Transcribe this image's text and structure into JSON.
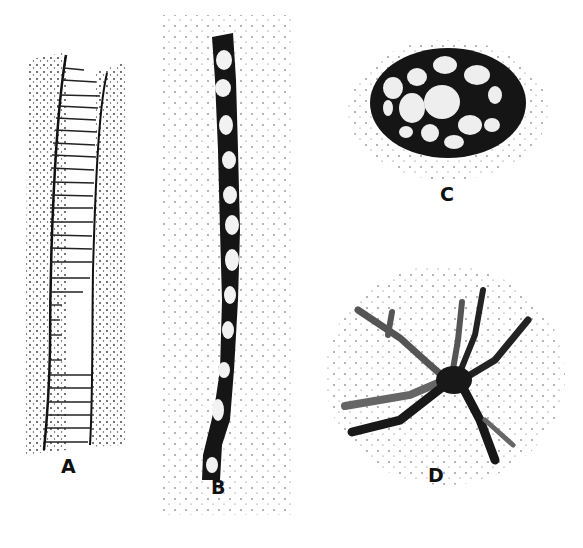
{
  "figure": {
    "panels": [
      {
        "id": "A",
        "label": "A",
        "description": "segmented ribbed tube / filament"
      },
      {
        "id": "B",
        "label": "B",
        "description": "dark chain of cells (filament)"
      },
      {
        "id": "C",
        "label": "C",
        "description": "oval colony with light cells in dark matrix"
      },
      {
        "id": "D",
        "label": "D",
        "description": "branching stellate body"
      }
    ]
  },
  "colors": {
    "ink": "#111111",
    "background": "#ffffff",
    "stipple": "#333333"
  }
}
